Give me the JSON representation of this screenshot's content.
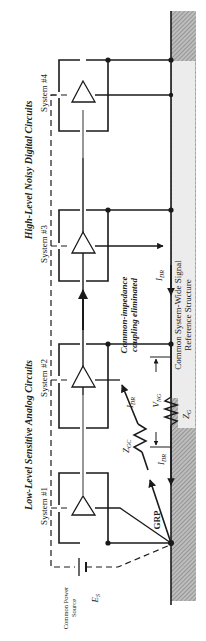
{
  "diagram": {
    "orientation": "rotated-90-ccw",
    "groups": {
      "analog": "Low-Level Sensitive Analog Circuits",
      "digital": "High-Level Noisy Digital Circuits"
    },
    "systems": [
      {
        "label": "System #1"
      },
      {
        "label": "System #2"
      },
      {
        "label": "System #3"
      },
      {
        "label": "System #4"
      }
    ],
    "power_source": {
      "label_line1": "Common Power",
      "label_line2": "Source",
      "symbol": "E",
      "symbol_sub": "S"
    },
    "annotations": {
      "coupling_line1": "Common-impedance",
      "coupling_line2": "coupling eliminated",
      "reference_line1": "Common System-Wide Signal",
      "reference_line2": "Reference Structure",
      "grp": "GRP",
      "idr": "I",
      "idr_sub": "DR",
      "zgc": "Z",
      "zgc_sub": "GC",
      "vng": "V",
      "vng_sub": "NG",
      "zg": "Z",
      "zg_sub": "G"
    },
    "colors": {
      "line": "#1a1a1a",
      "ground_hatch": "#9a9a9a",
      "reference_fill": "#e6e6e6"
    }
  }
}
